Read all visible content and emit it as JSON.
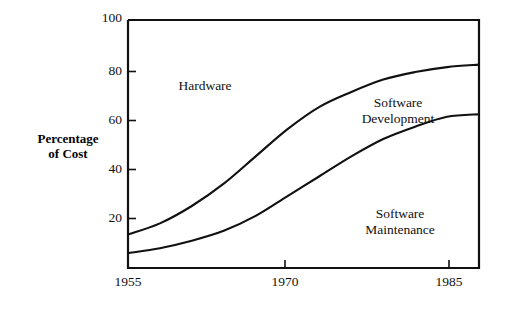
{
  "chart_data": {
    "type": "area",
    "title": "",
    "subtitle": "",
    "xlabel": "",
    "ylabel": "Percentage\nof Cost",
    "ylabel_lines": [
      "Percentage",
      "of Cost"
    ],
    "xlim": [
      1955,
      1988
    ],
    "ylim": [
      0,
      100
    ],
    "grid": false,
    "legend_position": "inline-annotations",
    "xticks": [
      {
        "value": 1955,
        "label": "1955"
      },
      {
        "value": 1970,
        "label": "1970"
      },
      {
        "value": 1985,
        "label": "1985"
      }
    ],
    "yticks": [
      {
        "value": 20,
        "label": "20"
      },
      {
        "value": 40,
        "label": "40"
      },
      {
        "value": 60,
        "label": "60"
      },
      {
        "value": 80,
        "label": "80"
      },
      {
        "value": 100,
        "label": "100"
      }
    ],
    "x": [
      1955,
      1958,
      1961,
      1964,
      1967,
      1970,
      1973,
      1976,
      1979,
      1982,
      1985,
      1988
    ],
    "series": [
      {
        "name": "Software Maintenance",
        "description": "Lower boundary curve: cumulative percentage of cost for software maintenance",
        "values": [
          6,
          8,
          11,
          15,
          21,
          29,
          37,
          45,
          52,
          57,
          61,
          62
        ]
      },
      {
        "name": "Software Development",
        "description": "Upper boundary curve: cumulative percentage of cost for maintenance plus development",
        "values": [
          13.5,
          18,
          25,
          34,
          45,
          56,
          65,
          71,
          76,
          79,
          81,
          82
        ]
      },
      {
        "name": "Hardware",
        "description": "Region above the upper curve up to 100 percent",
        "values": [
          86.5,
          82,
          75,
          66,
          55,
          44,
          35,
          29,
          24,
          21,
          19,
          18
        ]
      }
    ],
    "annotations": [
      {
        "id": "hardware",
        "text_lines": [
          "Hardware"
        ],
        "x": 1964,
        "y": 74
      },
      {
        "id": "software-development",
        "text_lines": [
          "Software",
          "Development"
        ],
        "x": 1974,
        "y": 67
      },
      {
        "id": "software-maintenance",
        "text_lines": [
          "Software",
          "Maintenance"
        ],
        "x": 1974,
        "y": 22
      }
    ],
    "colors": {
      "line": "#111111",
      "axis": "#111111",
      "background": "#ffffff",
      "text": "#111111"
    }
  }
}
